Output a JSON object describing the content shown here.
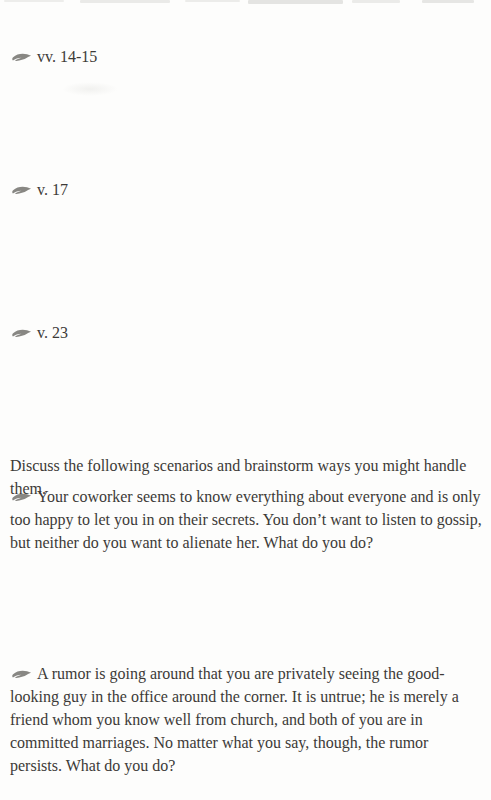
{
  "page": {
    "background": "#fdfdfc",
    "text_color": "#3c3a37",
    "ornament_color": "#6e6c68",
    "ornament_icon": "swoosh-ornament-icon",
    "verse_prompts": [
      {
        "label": "vv. 14-15"
      },
      {
        "label": "v. 17"
      },
      {
        "label": "v. 23"
      }
    ],
    "discussion_intro": "Discuss the following scenarios and brainstorm ways you might handle them.",
    "scenarios": [
      {
        "text": "Your coworker seems to know everything about everyone and is only too happy to let you in on their secrets. You don’t want to listen to gossip, but neither do you want to alienate her. What do you do?"
      },
      {
        "text": "A rumor is going around that you are privately seeing the good-looking guy in the office around the corner. It is untrue; he is merely a friend whom you know well from church, and both of you are in committed marriages. No matter what you say, though, the rumor persists. What do you do?"
      }
    ]
  }
}
